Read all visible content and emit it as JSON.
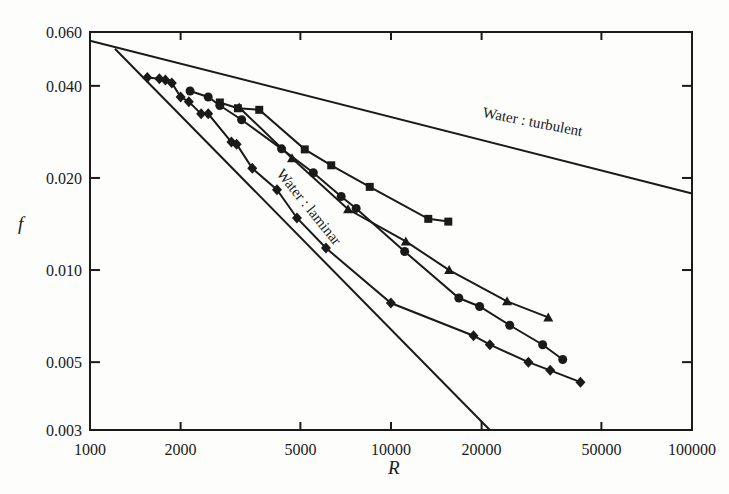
{
  "chart_data": {
    "type": "line",
    "title": "",
    "xlabel": "R",
    "ylabel": "f",
    "xscale": "log",
    "yscale": "log",
    "xlim": [
      1000,
      100000
    ],
    "ylim": [
      0.003,
      0.06
    ],
    "grid": false,
    "legend": "none",
    "x_ticks": [
      1000,
      2000,
      5000,
      10000,
      20000,
      50000,
      100000
    ],
    "x_tick_labels": [
      "1000",
      "2000",
      "5000",
      "10000",
      "20000",
      "50000",
      "100000"
    ],
    "y_ticks": [
      0.06,
      0.04,
      0.02,
      0.01,
      0.005,
      0.003
    ],
    "y_tick_labels": [
      "0.060",
      "0.040",
      "0.020",
      "0.010",
      "0.005",
      "0.003"
    ],
    "reference_lines": [
      {
        "name": "Water: turbulent",
        "label": "Water : turbulent",
        "formula": "f = 0.316 / R^0.25",
        "x": [
          1000,
          100000
        ],
        "y": [
          0.0562,
          0.0178
        ]
      },
      {
        "name": "Water: laminar",
        "label": "Water : laminar",
        "formula": "f = 64 / R",
        "x": [
          1210,
          21300
        ],
        "y": [
          0.0529,
          0.003
        ]
      }
    ],
    "series": [
      {
        "name": "squares",
        "marker": "square",
        "x": [
          2700,
          3100,
          3650,
          5170,
          6330,
          8500,
          13300,
          15500
        ],
        "y": [
          0.0353,
          0.0338,
          0.0334,
          0.0248,
          0.022,
          0.0187,
          0.0147,
          0.0144
        ]
      },
      {
        "name": "triangles",
        "marker": "triangle",
        "x": [
          3130,
          4690,
          7200,
          11200,
          15600,
          24300,
          33300
        ],
        "y": [
          0.034,
          0.0232,
          0.0158,
          0.0124,
          0.01,
          0.0079,
          0.007
        ]
      },
      {
        "name": "circles",
        "marker": "circle",
        "x": [
          2150,
          2470,
          2700,
          3190,
          4330,
          5520,
          6830,
          7660,
          11100,
          16800,
          19700,
          24800,
          31900,
          37200
        ],
        "y": [
          0.0385,
          0.0368,
          0.0345,
          0.031,
          0.0249,
          0.0208,
          0.0174,
          0.0159,
          0.0115,
          0.0081,
          0.0076,
          0.0066,
          0.0057,
          0.0051
        ]
      },
      {
        "name": "diamonds",
        "marker": "diamond",
        "x": [
          1550,
          1700,
          1780,
          1870,
          2000,
          2130,
          2340,
          2470,
          2950,
          3070,
          3460,
          4180,
          4870,
          6080,
          9990,
          18800,
          21300,
          28600,
          33800,
          42600
        ],
        "y": [
          0.0426,
          0.0422,
          0.0418,
          0.0409,
          0.0368,
          0.0355,
          0.0324,
          0.0324,
          0.0262,
          0.0258,
          0.0215,
          0.0183,
          0.0148,
          0.0118,
          0.0078,
          0.0061,
          0.0057,
          0.005,
          0.0047,
          0.0043
        ]
      }
    ]
  },
  "annotations": {
    "turbulent_label": "Water : turbulent",
    "laminar_label": "Water : laminar"
  },
  "axes": {
    "x_title": "R",
    "y_title": "f"
  }
}
